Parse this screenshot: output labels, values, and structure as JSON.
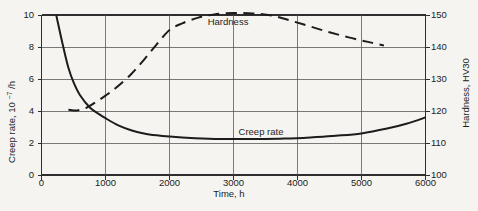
{
  "figure": {
    "background_color": "#f5f4f1",
    "ink_color": "#1c1c1c",
    "grid_color": "#5a5a5a",
    "frame_color": "#2e2e2e"
  },
  "chart_data": {
    "type": "line",
    "title": "",
    "xlabel": "Time, h",
    "xlim": [
      0,
      6000
    ],
    "x_ticks": [
      0,
      1000,
      2000,
      3000,
      4000,
      5000,
      6000
    ],
    "grid": true,
    "legend_position": "inline-curve-labels",
    "left_axis": {
      "label": "Creep rate, 10⁻⁷/h",
      "label_parts": [
        "Creep rate, 10",
        "−7",
        "/h"
      ],
      "ticks": [
        0,
        2,
        4,
        6,
        8,
        10
      ],
      "range": [
        0,
        10
      ]
    },
    "right_axis": {
      "label": "Hardness, HV30",
      "ticks": [
        100,
        110,
        120,
        130,
        140,
        150
      ],
      "range": [
        100,
        150
      ]
    },
    "series": [
      {
        "name": "Creep rate",
        "axis": "left",
        "line_style": "solid",
        "label_pos": {
          "t": 3430,
          "value": 2.5
        },
        "points": [
          [
            230,
            10
          ],
          [
            340,
            8
          ],
          [
            420,
            6.7
          ],
          [
            500,
            5.8
          ],
          [
            600,
            5.0
          ],
          [
            760,
            4.2
          ],
          [
            900,
            3.8
          ],
          [
            1000,
            3.55
          ],
          [
            1200,
            3.1
          ],
          [
            1400,
            2.8
          ],
          [
            1600,
            2.6
          ],
          [
            1800,
            2.48
          ],
          [
            2000,
            2.4
          ],
          [
            2400,
            2.3
          ],
          [
            2800,
            2.25
          ],
          [
            3300,
            2.25
          ],
          [
            3800,
            2.28
          ],
          [
            4200,
            2.35
          ],
          [
            4600,
            2.45
          ],
          [
            5000,
            2.6
          ],
          [
            5400,
            2.9
          ],
          [
            5700,
            3.2
          ],
          [
            6000,
            3.6
          ]
        ]
      },
      {
        "name": "Hardness",
        "axis": "right",
        "line_style": "dashed",
        "label_pos": {
          "t": 2915,
          "value": 147.0
        },
        "points": [
          [
            420,
            120.4
          ],
          [
            560,
            120.2
          ],
          [
            700,
            121.0
          ],
          [
            850,
            122.8
          ],
          [
            1000,
            124.8
          ],
          [
            1150,
            127.0
          ],
          [
            1400,
            131.5
          ],
          [
            1600,
            136.0
          ],
          [
            1800,
            140.8
          ],
          [
            2000,
            145.3
          ],
          [
            2200,
            147.4
          ],
          [
            2450,
            149.2
          ],
          [
            2700,
            150.2
          ],
          [
            3000,
            150.6
          ],
          [
            3300,
            150.5
          ],
          [
            3600,
            149.8
          ],
          [
            3900,
            148.2
          ],
          [
            4200,
            146.4
          ],
          [
            4500,
            144.6
          ],
          [
            4800,
            143.0
          ],
          [
            5100,
            141.6
          ],
          [
            5350,
            140.5
          ]
        ]
      }
    ]
  }
}
